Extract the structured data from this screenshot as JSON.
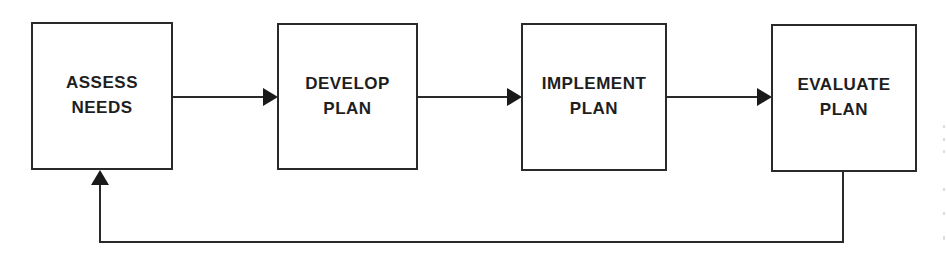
{
  "diagram": {
    "type": "process-cycle",
    "steps": [
      {
        "id": "assess",
        "line1": "ASSESS",
        "line2": "NEEDS"
      },
      {
        "id": "develop",
        "line1": "DEVELOP",
        "line2": "PLAN"
      },
      {
        "id": "implement",
        "line1": "IMPLEMENT",
        "line2": "PLAN"
      },
      {
        "id": "evaluate",
        "line1": "EVALUATE",
        "line2": "PLAN"
      }
    ],
    "edges": [
      {
        "from": "assess",
        "to": "develop"
      },
      {
        "from": "develop",
        "to": "implement"
      },
      {
        "from": "implement",
        "to": "evaluate"
      },
      {
        "from": "evaluate",
        "to": "assess",
        "kind": "feedback-loop"
      }
    ],
    "colors": {
      "stroke": "#2a2a2a",
      "text": "#1e1e1e",
      "background": "#ffffff"
    }
  }
}
